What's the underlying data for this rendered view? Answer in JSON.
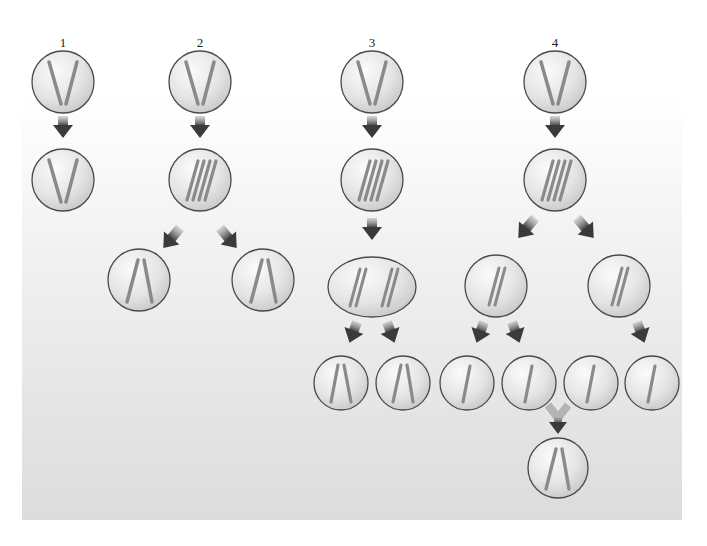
{
  "figure": {
    "panels": [
      {
        "label": "1",
        "description": "Mitosis without DNA replication"
      },
      {
        "label": "2",
        "description": "Replication then division into two diploid cells"
      },
      {
        "label": "3",
        "description": "Replication, first division, second division"
      },
      {
        "label": "4",
        "description": "Meiosis producing four haploid cells, two fuse"
      }
    ]
  },
  "colors": {
    "background_top": "#ffffff",
    "background_bottom": "#dcdcdc",
    "cell_fill_light": "#f4f4f4",
    "cell_fill_dark": "#c8c8c8",
    "cell_stroke": "#4a4a4a",
    "chromosome": "#8a8a8a",
    "arrow": "#3c3c3c"
  }
}
